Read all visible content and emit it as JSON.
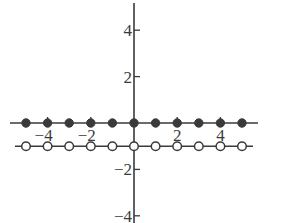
{
  "chart_data": {
    "type": "scatter",
    "title": "",
    "xlabel": "",
    "ylabel": "",
    "xlim": [
      -6,
      6
    ],
    "ylim": [
      -5,
      5
    ],
    "grid": false,
    "legend": null,
    "x_ticks": [
      -4,
      -2,
      2,
      4
    ],
    "y_ticks": [
      4,
      2,
      -2,
      -4
    ],
    "x_tick_labels": [
      "−4",
      "−2",
      "2",
      "4"
    ],
    "y_tick_labels": [
      "4",
      "2",
      "−2",
      "−4"
    ],
    "series": [
      {
        "name": "filled points",
        "marker": "filled-circle",
        "line": true,
        "x": [
          -5,
          -4,
          -3,
          -2,
          -1,
          0,
          1,
          2,
          3,
          4,
          5
        ],
        "y": [
          0,
          0,
          0,
          0,
          0,
          0,
          0,
          0,
          0,
          0,
          0
        ]
      },
      {
        "name": "open points",
        "marker": "open-circle",
        "line": true,
        "x": [
          -5,
          -4,
          -3,
          -2,
          -1,
          0,
          1,
          2,
          3,
          4,
          5
        ],
        "y": [
          -1,
          -1,
          -1,
          -1,
          -1,
          -1,
          -1,
          -1,
          -1,
          -1,
          -1
        ]
      }
    ],
    "colors": {
      "ink": "#3a3a3a",
      "background": "#ffffff"
    }
  }
}
